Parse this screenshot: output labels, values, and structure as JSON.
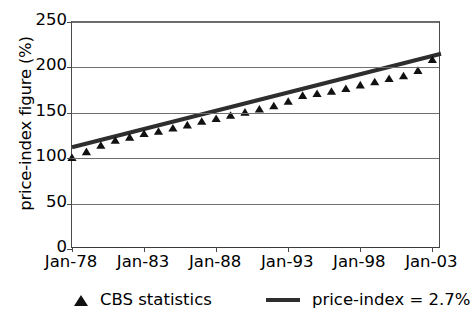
{
  "chart_data": {
    "type": "scatter",
    "title": "",
    "xlabel": "",
    "ylabel": "price-index figure (%)",
    "ylim": [
      0,
      250
    ],
    "yticks": [
      0,
      50,
      100,
      150,
      200,
      250
    ],
    "ytick_labels": [
      "0",
      "50",
      "100",
      "150",
      "200",
      "250"
    ],
    "grid": true,
    "xlim": [
      1978,
      2003.6
    ],
    "xticks": [
      1978,
      1983,
      1988,
      1993,
      1998,
      2003
    ],
    "xtick_labels": [
      "Jan-78",
      "Jan-83",
      "Jan-88",
      "Jan-93",
      "Jan-98",
      "Jan-03"
    ],
    "legend_position": "below",
    "series": [
      {
        "name": "CBS statistics",
        "type": "scatter",
        "marker": "triangle",
        "color": "#111111",
        "x": [
          1978,
          1979,
          1980,
          1981,
          1982,
          1983,
          1984,
          1985,
          1986,
          1987,
          1988,
          1989,
          1990,
          1991,
          1992,
          1993,
          1994,
          1995,
          1996,
          1997,
          1998,
          1999,
          2000,
          2001,
          2002,
          2003
        ],
        "values": [
          100,
          106.5,
          113.5,
          119,
          122.5,
          126.5,
          129,
          132.5,
          136,
          140,
          143,
          146.5,
          150,
          153.5,
          157,
          162,
          168.5,
          170.5,
          173,
          176,
          180,
          183.5,
          187,
          190,
          196,
          208
        ]
      },
      {
        "name": "price-index = 2.7%",
        "type": "line",
        "color": "#2e2e2e",
        "growth_rate_percent": 2.7,
        "x": [
          1978,
          2003.6
        ],
        "values": [
          112,
          215
        ]
      }
    ],
    "legend": [
      {
        "label": "CBS statistics",
        "marker": "triangle",
        "color": "#111111"
      },
      {
        "label": "price-index = 2.7%",
        "marker": "line",
        "color": "#2e2e2e"
      }
    ]
  },
  "colors": {
    "marker": "#111111",
    "trend_line": "#2e2e2e",
    "gridline": "#6f6f6f",
    "axis": "#4a4a4a",
    "background": "#ffffff",
    "text": "#000000"
  }
}
